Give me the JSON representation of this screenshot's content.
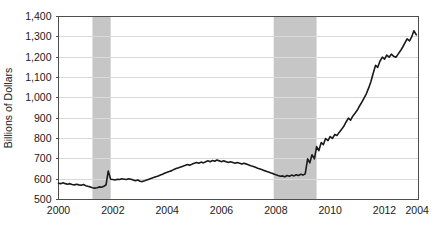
{
  "chart_data": {
    "type": "line",
    "title": "",
    "subtitle": "",
    "xlabel": "",
    "ylabel": "Billions of Dollars",
    "xlim": [
      2000,
      2013.25
    ],
    "ylim": [
      500,
      1400
    ],
    "grid": true,
    "grid_axis": "y",
    "legend": "none",
    "y_ticks": [
      "500",
      "600",
      "700",
      "800",
      "900",
      "1,000",
      "1,100",
      "1,200",
      "1,300",
      "1,400"
    ],
    "y_tick_values": [
      500,
      600,
      700,
      800,
      900,
      1000,
      1100,
      1200,
      1300,
      1400
    ],
    "x_ticks": [
      "2000",
      "2002",
      "2004",
      "2006",
      "2008",
      "2010",
      "2012",
      "2004"
    ],
    "x_tick_values": [
      2000,
      2002,
      2004,
      2006,
      2008,
      2010,
      2012,
      2013.2
    ],
    "colors": {
      "line": "#1a1a1a",
      "band": "#c6c6c6",
      "grid": "#d9d9d9",
      "frame": "#4d4d4d",
      "background": "#ffffff",
      "text": "#1a1a1a"
    },
    "shaded_regions": [
      {
        "name": "recession-2001",
        "x0": 2001.25,
        "x1": 2001.92
      },
      {
        "name": "recession-2008",
        "x0": 2007.92,
        "x1": 2009.5
      }
    ],
    "series": [
      {
        "name": "currency-in-circulation",
        "x": [
          2000.0,
          2000.08,
          2000.17,
          2000.25,
          2000.33,
          2000.42,
          2000.5,
          2000.58,
          2000.67,
          2000.75,
          2000.83,
          2000.92,
          2001.0,
          2001.08,
          2001.17,
          2001.25,
          2001.33,
          2001.42,
          2001.5,
          2001.58,
          2001.67,
          2001.75,
          2001.83,
          2001.92,
          2002.0,
          2002.08,
          2002.17,
          2002.25,
          2002.33,
          2002.42,
          2002.5,
          2002.58,
          2002.67,
          2002.75,
          2002.83,
          2002.92,
          2003.0,
          2003.08,
          2003.17,
          2003.25,
          2003.33,
          2003.42,
          2003.5,
          2003.58,
          2003.67,
          2003.75,
          2003.83,
          2003.92,
          2004.0,
          2004.08,
          2004.17,
          2004.25,
          2004.33,
          2004.42,
          2004.5,
          2004.58,
          2004.67,
          2004.75,
          2004.83,
          2004.92,
          2005.0,
          2005.08,
          2005.17,
          2005.25,
          2005.33,
          2005.42,
          2005.5,
          2005.58,
          2005.67,
          2005.75,
          2005.83,
          2005.92,
          2006.0,
          2006.08,
          2006.17,
          2006.25,
          2006.33,
          2006.42,
          2006.5,
          2006.58,
          2006.67,
          2006.75,
          2006.83,
          2006.92,
          2007.0,
          2007.08,
          2007.17,
          2007.25,
          2007.33,
          2007.42,
          2007.5,
          2007.58,
          2007.67,
          2007.75,
          2007.83,
          2007.92,
          2008.0,
          2008.08,
          2008.17,
          2008.25,
          2008.33,
          2008.42,
          2008.5,
          2008.58,
          2008.67,
          2008.75,
          2008.83,
          2008.92,
          2009.0,
          2009.08,
          2009.17,
          2009.25,
          2009.33,
          2009.42,
          2009.5,
          2009.58,
          2009.67,
          2009.75,
          2009.83,
          2009.92,
          2010.0,
          2010.08,
          2010.17,
          2010.25,
          2010.33,
          2010.42,
          2010.5,
          2010.58,
          2010.67,
          2010.75,
          2010.83,
          2010.92,
          2011.0,
          2011.08,
          2011.17,
          2011.25,
          2011.33,
          2011.42,
          2011.5,
          2011.58,
          2011.67,
          2011.75,
          2011.83,
          2011.92,
          2012.0,
          2012.08,
          2012.17,
          2012.25,
          2012.33,
          2012.42,
          2012.5,
          2012.58,
          2012.67,
          2012.75,
          2012.83,
          2012.92,
          2013.0,
          2013.08,
          2013.17
        ],
        "y": [
          580,
          578,
          582,
          578,
          575,
          578,
          574,
          572,
          575,
          572,
          570,
          574,
          568,
          565,
          562,
          558,
          556,
          558,
          562,
          560,
          565,
          572,
          640,
          600,
          598,
          596,
          600,
          598,
          602,
          600,
          598,
          602,
          600,
          596,
          592,
          596,
          590,
          588,
          592,
          596,
          600,
          604,
          608,
          612,
          616,
          620,
          624,
          630,
          634,
          638,
          642,
          648,
          652,
          656,
          660,
          664,
          668,
          672,
          668,
          674,
          678,
          682,
          678,
          684,
          680,
          686,
          690,
          686,
          692,
          688,
          694,
          690,
          686,
          690,
          686,
          682,
          686,
          682,
          678,
          682,
          678,
          674,
          678,
          674,
          670,
          666,
          662,
          658,
          654,
          650,
          646,
          642,
          638,
          634,
          630,
          626,
          622,
          618,
          614,
          616,
          612,
          618,
          614,
          620,
          616,
          622,
          618,
          624,
          620,
          626,
          700,
          680,
          720,
          700,
          760,
          740,
          780,
          770,
          800,
          790,
          810,
          800,
          820,
          815,
          830,
          845,
          860,
          880,
          900,
          890,
          910,
          925,
          940,
          960,
          980,
          1000,
          1020,
          1050,
          1080,
          1120,
          1160,
          1150,
          1180,
          1200,
          1190,
          1210,
          1200,
          1215,
          1205,
          1200,
          1215,
          1230,
          1250,
          1270,
          1290,
          1280,
          1300,
          1330,
          1310
        ]
      }
    ]
  }
}
